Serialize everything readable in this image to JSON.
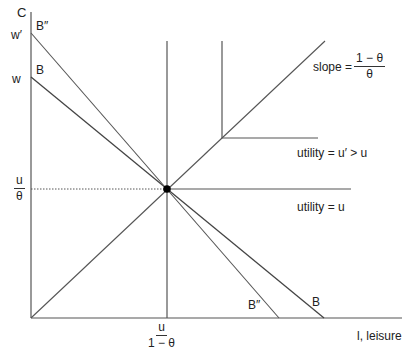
{
  "diagram": {
    "axes": {
      "y_label": "C",
      "x_label": "l, leisure",
      "y_ticks": {
        "w_prime": "w′",
        "w": "w"
      },
      "y_frac": {
        "num": "u",
        "den": "θ"
      },
      "x_frac": {
        "num": "u",
        "den": "1 − θ"
      }
    },
    "budget_lines": {
      "B_top": "B",
      "B_bottom": "B",
      "Bpp_top": "B″",
      "Bpp_bottom": "B″"
    },
    "ray": {
      "slope_label": "slope =",
      "slope_frac": {
        "num": "1 − θ",
        "den": "θ"
      }
    },
    "utility": {
      "upper": "utility = u′ > u",
      "lower": "utility = u"
    },
    "colors": {
      "line": "#444444",
      "dot": "#000000"
    }
  }
}
